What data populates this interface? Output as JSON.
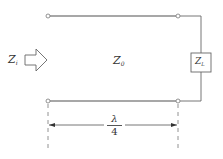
{
  "diagram": {
    "input_impedance": {
      "symbol": "Z",
      "subscript": "i"
    },
    "line_impedance": {
      "symbol": "Z",
      "subscript": "0"
    },
    "load_impedance": {
      "symbol": "Z",
      "subscript": "L"
    },
    "length": {
      "numerator": "λ",
      "denominator": "4"
    },
    "colors": {
      "line": "#8a8a8a",
      "stroke": "#555555",
      "text": "#333333",
      "background": "#ffffff"
    }
  }
}
